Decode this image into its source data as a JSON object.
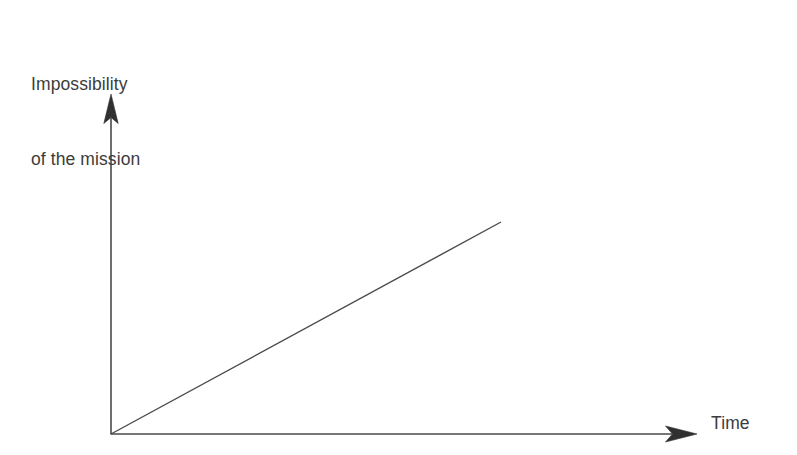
{
  "figure": {
    "background_color": "#ffffff",
    "line_color": "#4a4a4a",
    "text_color": "#3c3c3c",
    "width": 797,
    "height": 455
  },
  "labels": {
    "y_axis_line1": "Impossibility",
    "y_axis_line2": "of the mission",
    "x_axis": "Time"
  },
  "chart_data": {
    "type": "line",
    "title": "",
    "subtitle": "",
    "xlabel": "Time",
    "ylabel": "Impossibility of the mission",
    "grid": false,
    "legend": null,
    "axes_style": "arrowed-open-axes",
    "tick_labels_x": [],
    "tick_labels_y": [],
    "xlim": [
      0,
      1
    ],
    "ylim": [
      0,
      1
    ],
    "annotations": [],
    "series": [
      {
        "name": "Impossibility of the mission",
        "comment": "Single straight rising line from the origin; purely conceptual, no numeric scale shown.",
        "x": [
          0,
          1
        ],
        "y": [
          0,
          1
        ],
        "color": "#4a4a4a",
        "linewidth": 1.4,
        "arrowhead": false
      }
    ]
  }
}
